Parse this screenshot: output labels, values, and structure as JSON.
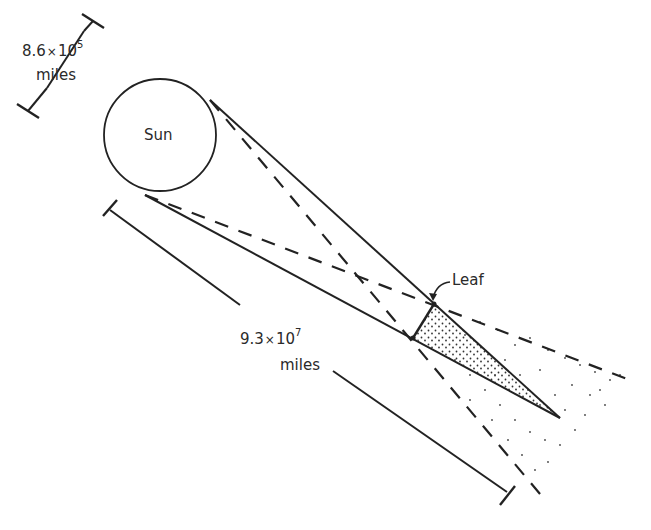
{
  "diagram": {
    "sun": {
      "label": "Sun",
      "cx": 160,
      "cy": 135,
      "r": 56
    },
    "leaf": {
      "label": "Leaf",
      "top": [
        434,
        304
      ],
      "bottom": [
        413,
        338
      ]
    },
    "umbra_tip": [
      560,
      418
    ],
    "sun_diameter": {
      "mantissa": "8.6",
      "times": "×",
      "base": "10",
      "exponent": "5",
      "unit": "miles"
    },
    "sun_distance": {
      "mantissa": "9.3",
      "times": "×",
      "base": "10",
      "exponent": "7",
      "unit": "miles"
    },
    "colors": {
      "ink": "#222222",
      "background": "#ffffff"
    }
  }
}
